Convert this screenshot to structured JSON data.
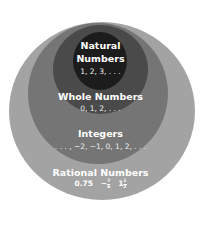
{
  "sets": [
    {
      "label": "Natural Numbers",
      "label_lines": [
        "Natural",
        "Numbers"
      ],
      "examples": "1, 2, 3, . . .",
      "color": "#1a1a1a"
    },
    {
      "label": "Whole Numbers",
      "examples": "0, 1, 2, . . .",
      "color": "#4a4a4a"
    },
    {
      "label": "Integers",
      "examples": ". . . , −2, −1, 0, 1, 2, . . .",
      "color": "#6f6f6f"
    },
    {
      "label": "Rational Numbers",
      "examples": {
        "decimal": "0.75",
        "neg_sign": "−",
        "frac1_num": "7",
        "frac1_den": "6",
        "mixed_whole": "1",
        "frac2_num": "1",
        "frac2_den": "2"
      },
      "color": "#a3a3a3"
    }
  ]
}
